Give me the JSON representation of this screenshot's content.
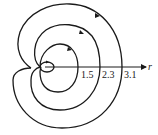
{
  "diagram": {
    "type": "spiral-trajectory",
    "axis": {
      "label": "r"
    },
    "tick_labels": [
      "1.5",
      "2.3",
      "3.1"
    ],
    "direction": "counterclockwise arrows",
    "colors": {
      "stroke": "#1a1a1a",
      "background": "#ffffff"
    }
  }
}
